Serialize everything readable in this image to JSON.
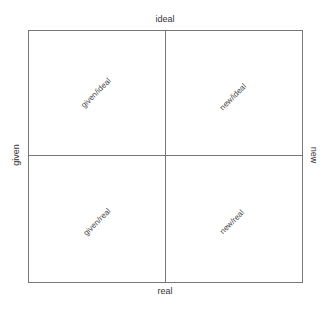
{
  "diagram": {
    "type": "quadrant",
    "axes": {
      "top": "ideal",
      "bottom": "real",
      "left": "given",
      "right": "new"
    },
    "quadrants": [
      {
        "position": "top-left",
        "label": "given/ideal"
      },
      {
        "position": "top-right",
        "label": "new/ideal"
      },
      {
        "position": "bottom-left",
        "label": "given/real"
      },
      {
        "position": "bottom-right",
        "label": "new/real"
      }
    ],
    "line_color": "#777777",
    "text_color": "#333333"
  }
}
